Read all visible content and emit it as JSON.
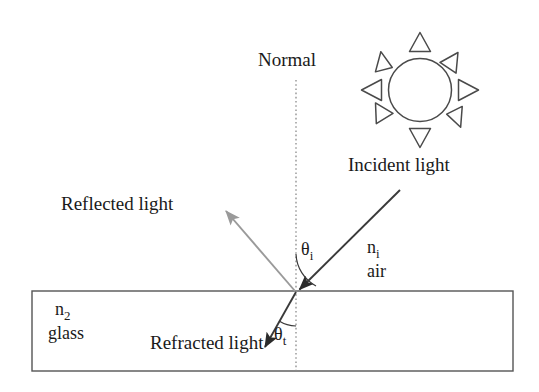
{
  "diagram": {
    "labels": {
      "normal": "Normal",
      "incident_light": "Incident light",
      "reflected_light": "Reflected light",
      "refracted_light": "Refracted light",
      "n_i": "n",
      "n_i_sub": "i",
      "air": "air",
      "n_2": "n",
      "n_2_sub": "2",
      "glass": "glass",
      "theta_i": "θ",
      "theta_i_sub": "i",
      "theta_t": "θ",
      "theta_t_sub": "t"
    },
    "colors": {
      "ink": "#1a1a1a",
      "ray_incident": "#3a3a3a",
      "ray_reflected": "#9a9a9a",
      "ray_refracted": "#3a3a3a",
      "normal_line": "#808080",
      "slab_border": "#555555",
      "background": "#ffffff"
    },
    "geometry": {
      "incidence_point": [
        296,
        292
      ],
      "normal_top": [
        296,
        80
      ],
      "normal_bottom": [
        296,
        371
      ],
      "incident_ray_start": [
        400,
        190
      ],
      "reflected_ray_end": [
        224,
        209
      ],
      "refracted_ray_end": [
        262,
        350
      ],
      "slab": {
        "x": 32,
        "y": 291,
        "width": 481,
        "height": 80
      },
      "sun_center": [
        420,
        90
      ],
      "sun_radius": 33,
      "sun_ray_count": 8
    }
  }
}
